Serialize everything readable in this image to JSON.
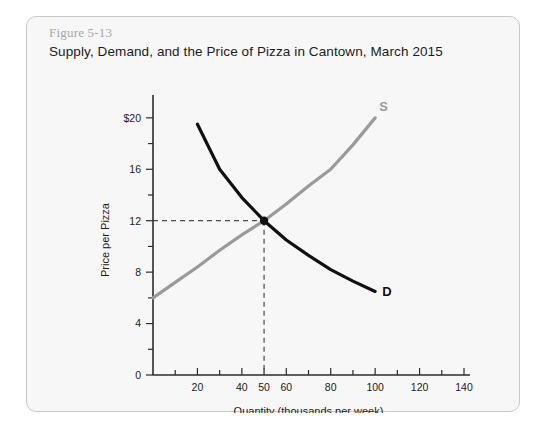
{
  "figure": {
    "number": "Figure 5-13",
    "title": "Supply, Demand, and the Price of Pizza in Cantown, March 2015"
  },
  "chart_data": {
    "type": "line",
    "title": "Supply, Demand, and the Price of Pizza in Cantown, March 2015",
    "xlabel": "Quantity (thousands per week)",
    "ylabel": "Price per Pizza",
    "xlim": [
      0,
      140
    ],
    "ylim": [
      0,
      21
    ],
    "grid": false,
    "legend_position": "inline-curve-labels",
    "x_ticks": [
      0,
      10,
      20,
      30,
      40,
      50,
      60,
      70,
      80,
      90,
      100,
      110,
      120,
      130,
      140
    ],
    "x_tick_labels": [
      "",
      "",
      "20",
      "",
      "40",
      "50",
      "60",
      "",
      "80",
      "",
      "100",
      "",
      "120",
      "",
      "140"
    ],
    "y_ticks": [
      0,
      2,
      4,
      6,
      8,
      10,
      12,
      14,
      16,
      18,
      20
    ],
    "y_tick_labels": [
      "0",
      "",
      "4",
      "",
      "8",
      "",
      "12",
      "",
      "16",
      "",
      "$20"
    ],
    "series": [
      {
        "name": "S",
        "label": "S",
        "color": "#9a9a9a",
        "points": [
          {
            "x": 0,
            "y": 6.0
          },
          {
            "x": 10,
            "y": 7.2
          },
          {
            "x": 20,
            "y": 8.4
          },
          {
            "x": 30,
            "y": 9.7
          },
          {
            "x": 40,
            "y": 10.9
          },
          {
            "x": 50,
            "y": 12.0
          },
          {
            "x": 60,
            "y": 13.3
          },
          {
            "x": 70,
            "y": 14.7
          },
          {
            "x": 80,
            "y": 16.0
          },
          {
            "x": 90,
            "y": 17.9
          },
          {
            "x": 100,
            "y": 20.0
          }
        ]
      },
      {
        "name": "D",
        "label": "D",
        "color": "#111111",
        "points": [
          {
            "x": 20,
            "y": 19.5
          },
          {
            "x": 30,
            "y": 16.0
          },
          {
            "x": 40,
            "y": 13.8
          },
          {
            "x": 50,
            "y": 12.0
          },
          {
            "x": 60,
            "y": 10.5
          },
          {
            "x": 70,
            "y": 9.3
          },
          {
            "x": 80,
            "y": 8.2
          },
          {
            "x": 90,
            "y": 7.3
          },
          {
            "x": 100,
            "y": 6.5
          }
        ]
      }
    ],
    "equilibrium": {
      "x": 50,
      "y": 12,
      "show_guides": true
    }
  }
}
